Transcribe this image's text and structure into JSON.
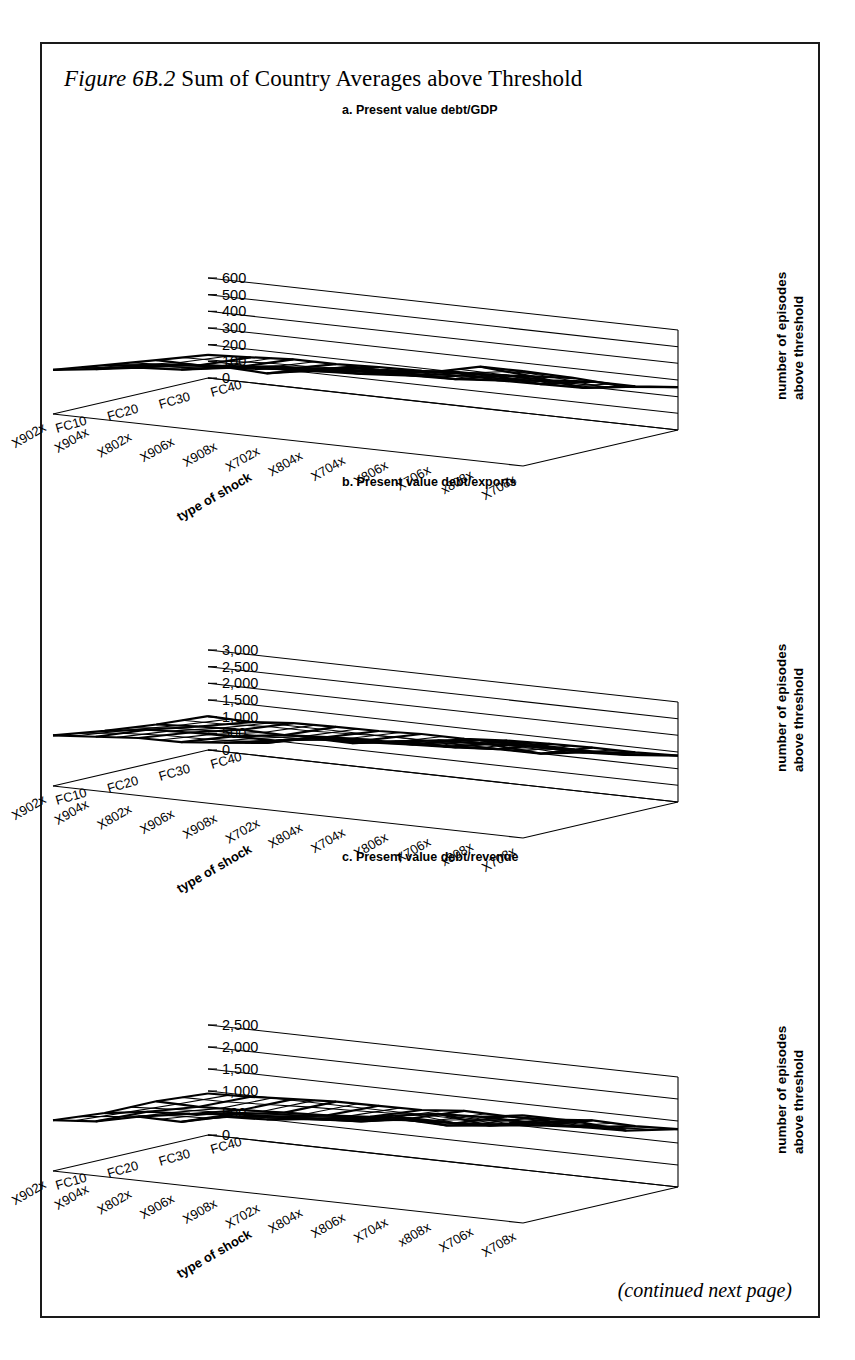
{
  "figure": {
    "label": "Figure 6B.2",
    "title": " Sum of Country Averages above Threshold",
    "footer": "(continued next page)"
  },
  "common": {
    "y_axis_label_line1": "number of episodes",
    "y_axis_label_line2": "above threshold",
    "x_axis_title": "type of shock",
    "x_categories": [
      "FC10",
      "FC20",
      "FC30",
      "FC40"
    ]
  },
  "chart_data": [
    {
      "type": "line",
      "render": "surface-3d-wireframe",
      "panel": "a",
      "title": "a. Present value debt/GDP",
      "xlabel": "type of shock",
      "ylabel": "number of episodes above threshold",
      "zlabel": "",
      "ylim": [
        0,
        600
      ],
      "yticks": [
        0,
        100,
        200,
        300,
        400,
        500,
        600
      ],
      "ytick_labels": [
        "0",
        "100",
        "200",
        "300",
        "400",
        "500",
        "600"
      ],
      "grid": true,
      "legend": "none",
      "x_categories": [
        "FC10",
        "FC20",
        "FC30",
        "FC40"
      ],
      "depth_categories": [
        "X708x",
        "x808x",
        "X706x",
        "X806x",
        "X704x",
        "X804x",
        "X702x",
        "X908x",
        "X906x",
        "X802x",
        "X904x",
        "X902x"
      ],
      "series": [
        {
          "name": "X708x",
          "values": [
            585,
            470,
            330,
            255
          ]
        },
        {
          "name": "x808x",
          "values": [
            545,
            440,
            310,
            240
          ]
        },
        {
          "name": "X706x",
          "values": [
            515,
            415,
            295,
            230
          ]
        },
        {
          "name": "X806x",
          "values": [
            490,
            395,
            282,
            222
          ]
        },
        {
          "name": "X704x",
          "values": [
            460,
            372,
            268,
            212
          ]
        },
        {
          "name": "X804x",
          "values": [
            432,
            352,
            255,
            202
          ]
        },
        {
          "name": "X702x",
          "values": [
            405,
            330,
            242,
            192
          ]
        },
        {
          "name": "X908x",
          "values": [
            378,
            310,
            228,
            182
          ]
        },
        {
          "name": "X906x",
          "values": [
            350,
            288,
            215,
            172
          ]
        },
        {
          "name": "X802x",
          "values": [
            322,
            268,
            200,
            162
          ]
        },
        {
          "name": "X904x",
          "values": [
            298,
            248,
            188,
            152
          ]
        },
        {
          "name": "X902x",
          "values": [
            272,
            228,
            175,
            142
          ]
        }
      ]
    },
    {
      "type": "line",
      "render": "surface-3d-wireframe",
      "panel": "b",
      "title": "b. Present value debt/exports",
      "xlabel": "type of shock",
      "ylabel": "number of episodes above threshold",
      "zlabel": "",
      "ylim": [
        0,
        3000
      ],
      "yticks": [
        0,
        500,
        1000,
        1500,
        2000,
        2500,
        3000
      ],
      "ytick_labels": [
        "0",
        "500",
        "1,000",
        "1,500",
        "2,000",
        "2,500",
        "3,000"
      ],
      "grid": true,
      "legend": "none",
      "x_categories": [
        "FC10",
        "FC20",
        "FC30",
        "FC40"
      ],
      "depth_categories": [
        "X708x",
        "x808x",
        "X706x",
        "X806x",
        "X704x",
        "X804x",
        "X702x",
        "X908x",
        "X906x",
        "X802x",
        "X904x",
        "X902x"
      ],
      "series": [
        {
          "name": "X708x",
          "values": [
            2950,
            2380,
            1720,
            1420
          ]
        },
        {
          "name": "x808x",
          "values": [
            2760,
            2250,
            1650,
            1375
          ]
        },
        {
          "name": "X706x",
          "values": [
            2600,
            2130,
            1585,
            1330
          ]
        },
        {
          "name": "X806x",
          "values": [
            2470,
            2030,
            1530,
            1290
          ]
        },
        {
          "name": "X704x",
          "values": [
            2330,
            1930,
            1470,
            1250
          ]
        },
        {
          "name": "X804x",
          "values": [
            2200,
            1840,
            1415,
            1210
          ]
        },
        {
          "name": "X702x",
          "values": [
            2070,
            1740,
            1360,
            1175
          ]
        },
        {
          "name": "X908x",
          "values": [
            1950,
            1650,
            1305,
            1135
          ]
        },
        {
          "name": "X906x",
          "values": [
            1820,
            1560,
            1250,
            1100
          ]
        },
        {
          "name": "X802x",
          "values": [
            1700,
            1465,
            1195,
            1060
          ]
        },
        {
          "name": "X904x",
          "values": [
            1580,
            1380,
            1140,
            1025
          ]
        },
        {
          "name": "X902x",
          "values": [
            1460,
            1290,
            1085,
            990
          ]
        }
      ]
    },
    {
      "type": "line",
      "render": "surface-3d-wireframe",
      "panel": "c",
      "title": "c. Present value debt/revenue",
      "xlabel": "type of shock",
      "ylabel": "number of episodes above threshold",
      "zlabel": "",
      "ylim": [
        0,
        2500
      ],
      "yticks": [
        0,
        500,
        1000,
        1500,
        2000,
        2500
      ],
      "ytick_labels": [
        "0",
        "500",
        "1,000",
        "1,500",
        "2,000",
        "2,500"
      ],
      "grid": true,
      "legend": "none",
      "x_categories": [
        "FC10",
        "FC20",
        "FC30",
        "FC40"
      ],
      "depth_categories": [
        "X708x",
        "X706x",
        "x808x",
        "X704x",
        "X806x",
        "X804x",
        "X702x",
        "X908x",
        "X906x",
        "X802x",
        "X904x",
        "X902x"
      ],
      "series": [
        {
          "name": "X708x",
          "values": [
            2450,
            1980,
            1530,
            1340
          ]
        },
        {
          "name": "X706x",
          "values": [
            2300,
            1880,
            1475,
            1300
          ]
        },
        {
          "name": "x808x",
          "values": [
            2175,
            1790,
            1420,
            1265
          ]
        },
        {
          "name": "X704x",
          "values": [
            2050,
            1700,
            1370,
            1230
          ]
        },
        {
          "name": "X806x",
          "values": [
            1940,
            1620,
            1320,
            1195
          ]
        },
        {
          "name": "X804x",
          "values": [
            1830,
            1545,
            1270,
            1160
          ]
        },
        {
          "name": "X702x",
          "values": [
            1725,
            1470,
            1225,
            1130
          ]
        },
        {
          "name": "X908x",
          "values": [
            1620,
            1395,
            1180,
            1095
          ]
        },
        {
          "name": "X906x",
          "values": [
            1520,
            1325,
            1135,
            1065
          ]
        },
        {
          "name": "X802x",
          "values": [
            1420,
            1255,
            1090,
            1030
          ]
        },
        {
          "name": "X904x",
          "values": [
            1325,
            1185,
            1045,
            1000
          ]
        },
        {
          "name": "X902x",
          "values": [
            1230,
            1115,
            1000,
            968
          ]
        }
      ]
    }
  ]
}
